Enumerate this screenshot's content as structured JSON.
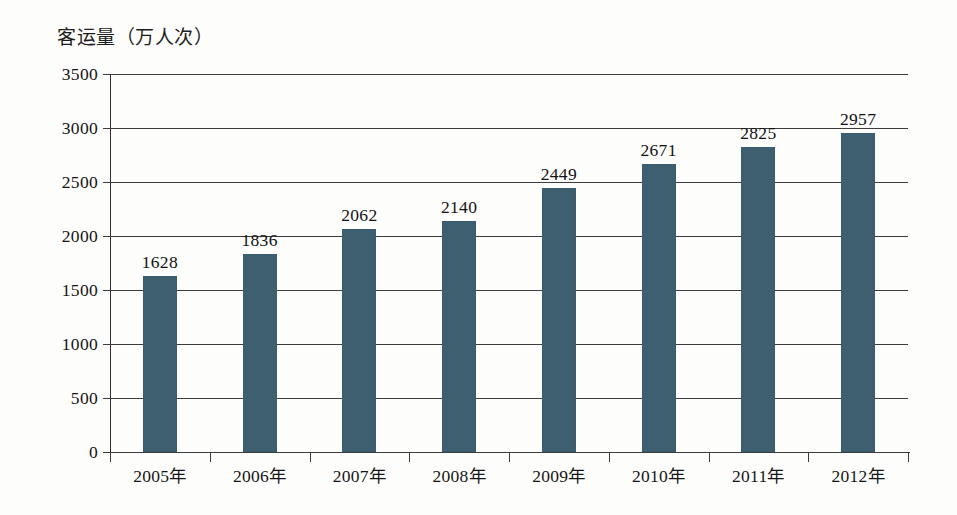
{
  "chart_data": {
    "type": "bar",
    "title": "客运量（万人次）",
    "xlabel": "",
    "ylabel": "客运量（万人次）",
    "categories": [
      "2005年",
      "2006年",
      "2007年",
      "2008年",
      "2009年",
      "2010年",
      "2011年",
      "2012年"
    ],
    "values": [
      1628,
      1836,
      2062,
      2140,
      2449,
      2671,
      2825,
      2957
    ],
    "value_labels": [
      "1628",
      "1836",
      "2062",
      "2140",
      "2449",
      "2671",
      "2825",
      "2957"
    ],
    "ylim": [
      0,
      3500
    ],
    "ytick_values": [
      0,
      500,
      1000,
      1500,
      2000,
      2500,
      3000,
      3500
    ],
    "ytick_labels": [
      "0",
      "500",
      "1000",
      "1500",
      "2000",
      "2500",
      "3000",
      "3500"
    ],
    "grid": true,
    "legend": false,
    "legend_position": "none",
    "bar_color": "#3d5f70",
    "axis_color": "#2e2e2e",
    "grid_color": "#3c3c3c",
    "background_color": "#fdfdfc",
    "text_color": "#141414"
  }
}
